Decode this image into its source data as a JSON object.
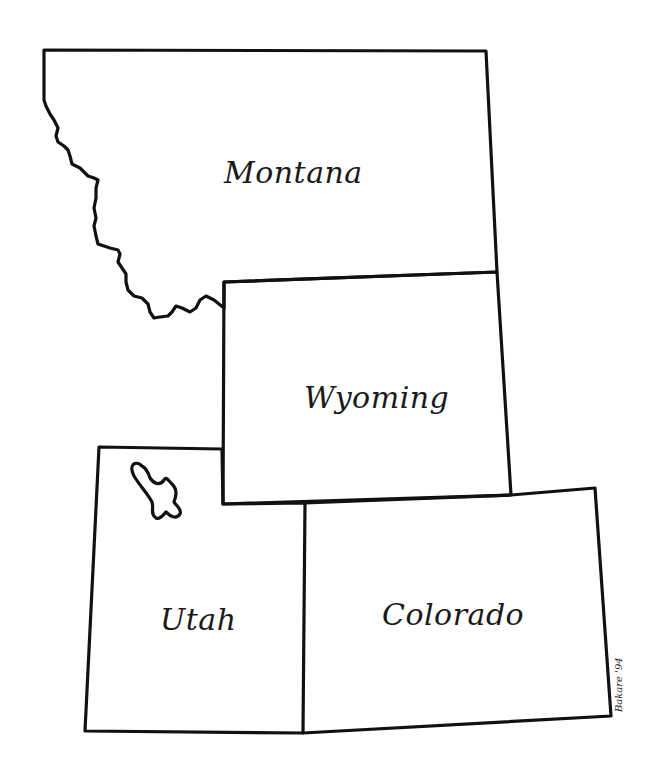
{
  "map": {
    "title": "Montana, Wyoming, Utah, Colorado outline map",
    "stroke_color": "#111111",
    "background": "#ffffff",
    "states": [
      {
        "id": "montana",
        "label": "Montana"
      },
      {
        "id": "wyoming",
        "label": "Wyoming"
      },
      {
        "id": "utah",
        "label": "Utah"
      },
      {
        "id": "colorado",
        "label": "Colorado"
      }
    ],
    "features": [
      {
        "id": "great-salt-lake",
        "type": "lake",
        "state": "Utah"
      }
    ],
    "signature": "Bakare '94"
  }
}
